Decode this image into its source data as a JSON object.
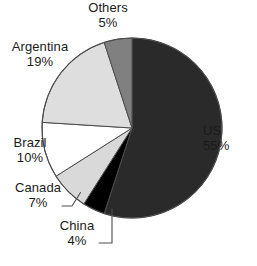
{
  "chart_data": {
    "type": "pie",
    "title": "",
    "subtitle": "",
    "xlabel": "",
    "ylabel": "",
    "legend_position": "none",
    "grid": false,
    "units": "percent",
    "start_angle_deg": 0,
    "direction": "clockwise",
    "categories": [
      "US",
      "China",
      "Canada",
      "Brazil",
      "Argentina",
      "Others"
    ],
    "values": [
      55,
      4,
      7,
      10,
      19,
      5
    ],
    "slices": [
      {
        "label": "US",
        "value": 55,
        "value_text": "55%",
        "color": "#2a2a2a",
        "start_pct": 0,
        "end_pct": 55,
        "label_position": "right",
        "has_leader_line": false
      },
      {
        "label": "China",
        "value": 4,
        "value_text": "4%",
        "color": "#000000",
        "start_pct": 55,
        "end_pct": 59,
        "label_position": "bottom",
        "has_leader_line": true
      },
      {
        "label": "Canada",
        "value": 7,
        "value_text": "7%",
        "color": "#d9d9d9",
        "start_pct": 59,
        "end_pct": 66,
        "label_position": "bottom-left",
        "has_leader_line": true
      },
      {
        "label": "Brazil",
        "value": 10,
        "value_text": "10%",
        "color": "#ffffff",
        "start_pct": 66,
        "end_pct": 76,
        "label_position": "left",
        "has_leader_line": false
      },
      {
        "label": "Argentina",
        "value": 19,
        "value_text": "19%",
        "color": "#dedede",
        "start_pct": 76,
        "end_pct": 95,
        "label_position": "top-left",
        "has_leader_line": false
      },
      {
        "label": "Others",
        "value": 5,
        "value_text": "5%",
        "color": "#808080",
        "start_pct": 95,
        "end_pct": 100,
        "label_position": "top",
        "has_leader_line": false
      }
    ]
  },
  "labels": {
    "others": {
      "name": "Others",
      "value": "5%"
    },
    "argentina": {
      "name": "Argentina",
      "value": "19%"
    },
    "brazil": {
      "name": "Brazil",
      "value": "10%"
    },
    "canada": {
      "name": "Canada",
      "value": "7%"
    },
    "china": {
      "name": "China",
      "value": "4%"
    },
    "us": {
      "name": "US",
      "value": "55%"
    }
  },
  "colors": {
    "us": "#2a2a2a",
    "china": "#000000",
    "canada": "#d9d9d9",
    "brazil": "#ffffff",
    "argentina": "#dedede",
    "others": "#808080",
    "outline": "#4d4d4d",
    "background": "#ffffff",
    "text": "#1a1a1a"
  }
}
